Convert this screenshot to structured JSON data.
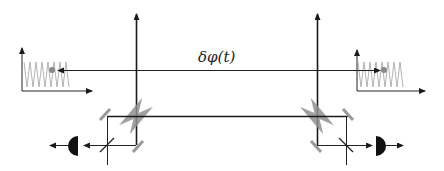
{
  "diagram": {
    "type": "optical-interferometer-schematic",
    "phase_label": "δφ(t)",
    "colors": {
      "beam": "#1a1a1a",
      "mirror": "#999999",
      "crystal": "#8f8f8f",
      "signal_trace": "#aaaaaa",
      "marker_dot": "#888888",
      "detector": "#111111"
    },
    "components": [
      {
        "name": "left-vertical-beam",
        "kind": "beam"
      },
      {
        "name": "right-vertical-beam",
        "kind": "beam"
      },
      {
        "name": "phase-link",
        "kind": "double-arrow",
        "label": "δφ(t)"
      },
      {
        "name": "left-crystal",
        "kind": "bow-tie-crystal"
      },
      {
        "name": "right-crystal",
        "kind": "bow-tie-crystal"
      },
      {
        "name": "left-beamsplitter",
        "kind": "beamsplitter"
      },
      {
        "name": "right-beamsplitter",
        "kind": "beamsplitter"
      },
      {
        "name": "left-detector",
        "kind": "photodetector"
      },
      {
        "name": "right-detector",
        "kind": "photodetector"
      },
      {
        "name": "left-fringe-plot",
        "kind": "oscillation-plot"
      },
      {
        "name": "right-fringe-plot",
        "kind": "oscillation-plot"
      }
    ]
  }
}
